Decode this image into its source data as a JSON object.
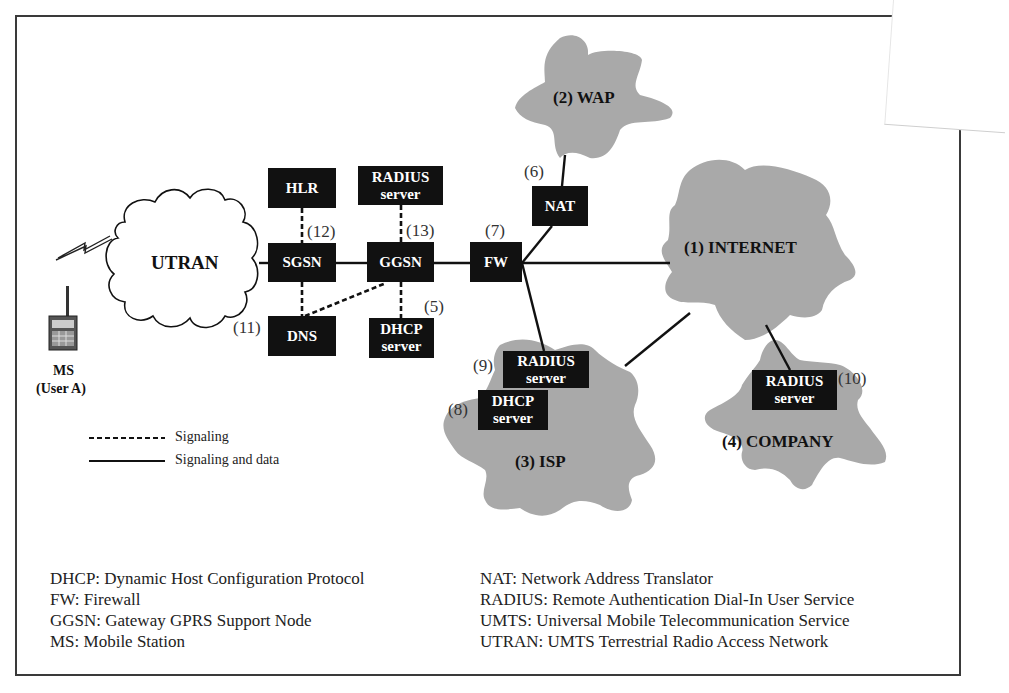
{
  "clouds": {
    "utran": "UTRAN",
    "wap": "(2) WAP",
    "internet": "(1) INTERNET",
    "isp": "(3) ISP",
    "company": "(4) COMPANY"
  },
  "mobile_station": {
    "line1": "MS",
    "line2": "(User A)"
  },
  "nodes": {
    "hlr": [
      "HLR"
    ],
    "radius_top": [
      "RADIUS",
      "server"
    ],
    "sgsn": [
      "SGSN"
    ],
    "ggsn": [
      "GGSN"
    ],
    "fw": [
      "FW"
    ],
    "nat": [
      "NAT"
    ],
    "dns": [
      "DNS"
    ],
    "dhcp_top": [
      "DHCP",
      "server"
    ],
    "radius_isp": [
      "RADIUS",
      "server"
    ],
    "dhcp_isp": [
      "DHCP",
      "server"
    ],
    "radius_company": [
      "RADIUS",
      "server"
    ]
  },
  "step_labels": {
    "s5": "(5)",
    "s6": "(6)",
    "s7": "(7)",
    "s8": "(8)",
    "s9": "(9)",
    "s10": "(10)",
    "s11": "(11)",
    "s12": "(12)",
    "s13": "(13)"
  },
  "legend": {
    "dashed": "Signaling",
    "solid": "Signaling and data"
  },
  "abbreviations": {
    "left": [
      "DHCP: Dynamic Host Configuration Protocol",
      "FW: Firewall",
      "GGSN: Gateway GPRS Support Node",
      "MS: Mobile Station"
    ],
    "right": [
      "NAT: Network Address Translator",
      "RADIUS: Remote Authentication Dial-In User Service",
      "UMTS: Universal Mobile Telecommunication Service",
      "UTRAN: UMTS Terrestrial Radio Access Network"
    ]
  },
  "colors": {
    "cloud_fill": "#a9a9a9",
    "node_fill": "#111111",
    "line": "#111111"
  }
}
